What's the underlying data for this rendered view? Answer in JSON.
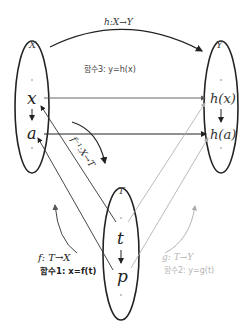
{
  "diagram": {
    "sets": {
      "X": {
        "label": "X",
        "elements": [
          "x",
          "a"
        ]
      },
      "Y": {
        "label": "Y",
        "elements": [
          "h(x)",
          "h(a)"
        ]
      },
      "T": {
        "label": "T",
        "elements": [
          "t",
          "p"
        ]
      }
    },
    "mappings": {
      "h": {
        "label": "h:X→Y",
        "formula_label": "함수3: y=h(x)",
        "color": "#222222"
      },
      "f_inverse": {
        "label": "f⁻¹:X→T",
        "color": "#222222"
      },
      "f": {
        "label": "f: T→X",
        "formula_label": "함수1: x=f(t)",
        "color": "#222222"
      },
      "g": {
        "label": "g: T→Y",
        "formula_label": "함수2: y=g(t)",
        "color": "#b0b0b0"
      }
    }
  }
}
